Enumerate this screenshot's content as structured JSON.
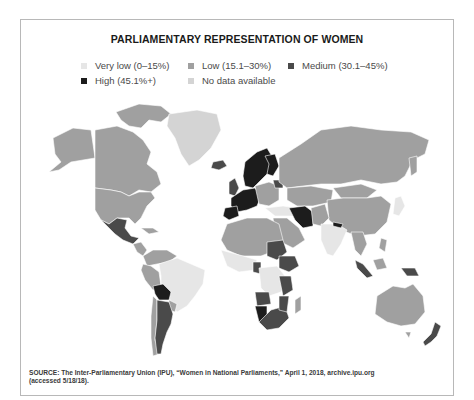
{
  "title": "PARLIAMENTARY REPRESENTATION OF WOMEN",
  "legend": [
    {
      "key": "very_low",
      "label": "Very low (0–15%)",
      "color": "#e6e6e6"
    },
    {
      "key": "low",
      "label": "Low (15.1–30%)",
      "color": "#a0a0a0"
    },
    {
      "key": "medium",
      "label": "Medium (30.1–45%)",
      "color": "#4a4a4a"
    },
    {
      "key": "high",
      "label": "High (45.1%+)",
      "color": "#1c1c1c"
    },
    {
      "key": "no_data",
      "label": "No data available",
      "color": "#d4d4d4"
    }
  ],
  "colors": {
    "very_low": "#e6e6e6",
    "low": "#a0a0a0",
    "medium": "#4a4a4a",
    "high": "#1c1c1c",
    "no_data": "#d4d4d4",
    "border": "#b8b8b8"
  },
  "regions": [
    {
      "name": "North America (Canada, USA)",
      "category": "low"
    },
    {
      "name": "Greenland",
      "category": "no_data"
    },
    {
      "name": "Mexico",
      "category": "medium"
    },
    {
      "name": "Central America",
      "category": "low"
    },
    {
      "name": "Brazil",
      "category": "very_low"
    },
    {
      "name": "Bolivia",
      "category": "high"
    },
    {
      "name": "Argentina",
      "category": "medium"
    },
    {
      "name": "Iceland",
      "category": "medium"
    },
    {
      "name": "Nordic countries",
      "category": "medium"
    },
    {
      "name": "Western Europe",
      "category": "medium"
    },
    {
      "name": "Russia",
      "category": "low"
    },
    {
      "name": "China",
      "category": "low"
    },
    {
      "name": "India",
      "category": "very_low"
    },
    {
      "name": "Iran",
      "category": "very_low"
    },
    {
      "name": "North Africa",
      "category": "low"
    },
    {
      "name": "Sub-Saharan Africa",
      "category": "very_low"
    },
    {
      "name": "Southern Africa",
      "category": "medium"
    },
    {
      "name": "Ethiopia",
      "category": "medium"
    },
    {
      "name": "Australia",
      "category": "low"
    },
    {
      "name": "New Zealand",
      "category": "medium"
    },
    {
      "name": "Indonesia",
      "category": "low"
    },
    {
      "name": "Japan",
      "category": "very_low"
    }
  ],
  "source": {
    "line1": "SOURCE: The Inter-Parliamentary Union (IPU), “Women in National Parliaments,” April 1, 2018, archive.ipu.org",
    "line2": "(accessed 5/18/18)."
  }
}
